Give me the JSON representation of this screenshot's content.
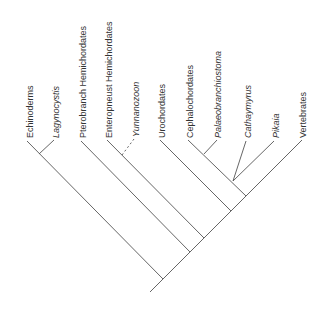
{
  "diagram": {
    "type": "cladogram",
    "taxa": [
      {
        "id": "echinoderms",
        "label": "Echinoderms",
        "italic": false,
        "x": 30,
        "fossil": false
      },
      {
        "id": "lagynocystis",
        "label": "Lagynocystis",
        "italic": true,
        "x": 56,
        "fossil": true
      },
      {
        "id": "pterobranch",
        "label": "Pterobranch Hemichordates",
        "italic": false,
        "x": 83,
        "fossil": false
      },
      {
        "id": "enteropneust",
        "label": "Enteropneust Hemichordates",
        "italic": false,
        "x": 109,
        "fossil": false
      },
      {
        "id": "yunnanozoon",
        "label": "Yunnanozoon",
        "italic": true,
        "x": 136,
        "fossil": true,
        "uncertain_placement": true
      },
      {
        "id": "urochordates",
        "label": "Urochordates",
        "italic": false,
        "x": 162,
        "fossil": false
      },
      {
        "id": "cephalochordates",
        "label": "Cephalochordates",
        "italic": false,
        "x": 190,
        "fossil": false
      },
      {
        "id": "palaeobranchiostoma",
        "label": "Palaeobranchiostoma",
        "italic": true,
        "x": 218,
        "fossil": true
      },
      {
        "id": "cathaymyrus",
        "label": "Cathaymyrus",
        "italic": true,
        "x": 248,
        "fossil": true
      },
      {
        "id": "pikaia",
        "label": "Pikaia",
        "italic": true,
        "x": 276,
        "fossil": true
      },
      {
        "id": "vertebrates",
        "label": "Vertebrates",
        "italic": false,
        "x": 303,
        "fossil": false
      }
    ],
    "colors": {
      "line": "#555555",
      "text": "#333333",
      "background": "#ffffff"
    }
  }
}
